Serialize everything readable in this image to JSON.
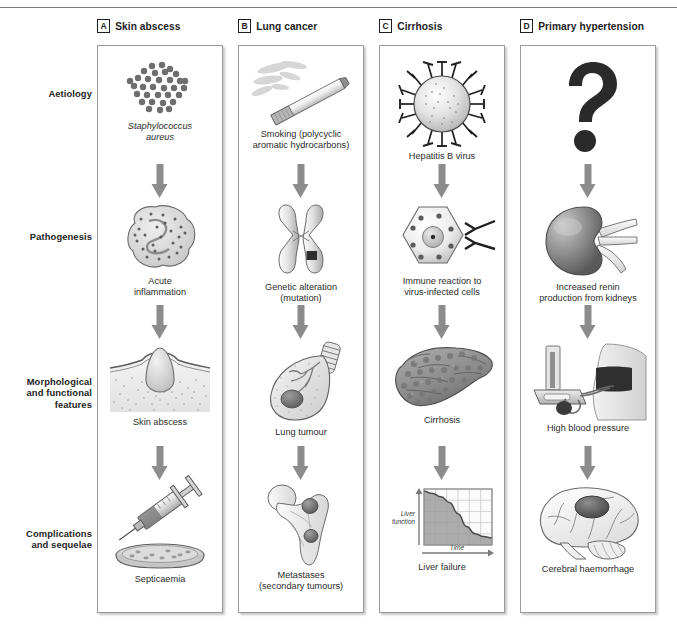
{
  "figure": {
    "row_labels": [
      {
        "id": "aetiology",
        "text": "Aetiology"
      },
      {
        "id": "pathogenesis",
        "text": "Pathogenesis"
      },
      {
        "id": "morphological",
        "text": "Morphological\nand functional\nfeatures"
      },
      {
        "id": "complications",
        "text": "Complications\nand sequelae"
      }
    ],
    "columns": [
      {
        "letter": "A",
        "title": "Skin abscess",
        "stages": [
          {
            "caption": "Staphylococcus\naureus",
            "italic": true,
            "art": "staphylococci-cluster"
          },
          {
            "caption": "Acute\ninflammation",
            "italic": false,
            "art": "inflamed-tissue"
          },
          {
            "caption": "Skin abscess",
            "italic": false,
            "art": "skin-abscess-section"
          },
          {
            "caption": "Septicaemia",
            "italic": false,
            "art": "syringe-and-petri-dish"
          }
        ]
      },
      {
        "letter": "B",
        "title": "Lung cancer",
        "stages": [
          {
            "caption": "Smoking (polycyclic\naromatic hydrocarbons)",
            "italic": false,
            "art": "burning-cigarette"
          },
          {
            "caption": "Genetic alteration\n(mutation)",
            "italic": false,
            "art": "chromosome"
          },
          {
            "caption": "Lung tumour",
            "italic": false,
            "art": "lung-with-tumour"
          },
          {
            "caption": "Metastases\n(secondary tumours)",
            "italic": false,
            "art": "femur-with-metastases"
          }
        ]
      },
      {
        "letter": "C",
        "title": "Cirrhosis",
        "stages": [
          {
            "caption": "Hepatitis B virus",
            "italic": false,
            "art": "hepatitis-b-virion"
          },
          {
            "caption": "Immune reaction to\nvirus-infected cells",
            "italic": false,
            "art": "infected-cell-with-lymphocytes"
          },
          {
            "caption": "Cirrhosis",
            "italic": false,
            "art": "cirrhotic-liver"
          },
          {
            "caption": "Liver failure",
            "italic": false,
            "art": "liver-function-chart"
          }
        ]
      },
      {
        "letter": "D",
        "title": "Primary hypertension",
        "stages": [
          {
            "caption": "",
            "italic": false,
            "art": "question-mark"
          },
          {
            "caption": "Increased renin\nproduction from kidneys",
            "italic": false,
            "art": "kidney"
          },
          {
            "caption": "High blood pressure",
            "italic": false,
            "art": "sphygmomanometer"
          },
          {
            "caption": "Cerebral haemorrhage",
            "italic": false,
            "art": "brain-with-haemorrhage"
          }
        ]
      }
    ]
  },
  "chart_data": {
    "type": "area",
    "title": "Liver failure",
    "xlabel": "Time",
    "ylabel": "Liver\nfunction",
    "x": [
      0,
      1,
      2,
      3,
      4,
      5,
      6,
      7,
      8
    ],
    "values": [
      96,
      92,
      86,
      76,
      56,
      33,
      20,
      15,
      13
    ],
    "xlim": [
      0,
      8
    ],
    "ylim": [
      0,
      100
    ],
    "grid": true,
    "gridlines_x": 6,
    "gridlines_y": 5,
    "legend": "none",
    "axis_label_style": "italic"
  },
  "colors": {
    "panel_border": "#9a9a9a",
    "arrow": "#8c8c8c",
    "text": "#2b2b2b",
    "header_text": "#1d1d1d",
    "question_mark": "#2a2a2a",
    "chart_fill": "#9e9e9e",
    "chart_grid": "#b8b8b8",
    "top_rule": "#7d7d7d"
  }
}
